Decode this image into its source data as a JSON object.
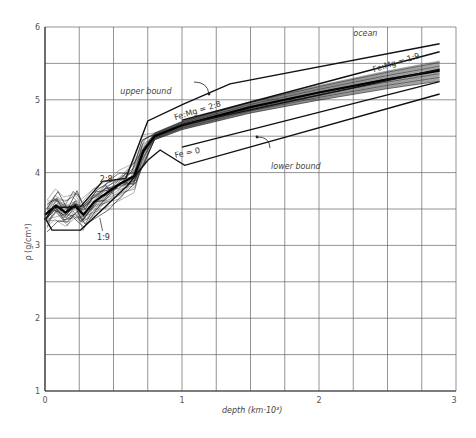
{
  "chart_data": {
    "type": "line",
    "title": "",
    "xlabel": "depth (km·10³)",
    "ylabel": "ρ (g/cm³)",
    "xlim": [
      0,
      3
    ],
    "ylim": [
      1,
      6
    ],
    "x_ticks": [
      "0",
      "1",
      "2",
      "3"
    ],
    "y_ticks": [
      "1",
      "2",
      "3",
      "4",
      "5",
      "6"
    ],
    "grid": true,
    "grid_x_step": 0.25,
    "grid_y_step": 0.5,
    "annotations": [
      {
        "text": "ocean",
        "x": 2.25,
        "y": 5.88,
        "italic": true
      },
      {
        "text": "upper bound",
        "x": 0.55,
        "y": 5.08,
        "italic": true
      },
      {
        "text": "lower bound",
        "x": 1.65,
        "y": 4.05,
        "italic": true
      },
      {
        "text": "Fe:Mg = 2:8",
        "x": 0.95,
        "y": 4.72,
        "rotate": -17
      },
      {
        "text": "Fe:Mg = 1:9",
        "x": 2.4,
        "y": 5.38,
        "rotate": -17
      },
      {
        "text": "Fe = 0",
        "x": 0.95,
        "y": 4.2,
        "rotate": -12
      },
      {
        "text": "2:8",
        "x": 0.4,
        "y": 3.87
      },
      {
        "text": "1:9",
        "x": 0.38,
        "y": 3.08
      }
    ],
    "series": [
      {
        "name": "upper bound",
        "style": "bold",
        "x": [
          0.0,
          0.06,
          0.26,
          0.42,
          0.59,
          0.75,
          1.01,
          1.35,
          2.88
        ],
        "y": [
          3.35,
          3.52,
          3.53,
          3.88,
          3.92,
          4.71,
          4.94,
          5.22,
          5.77
        ]
      },
      {
        "name": "lower bound",
        "style": "bold",
        "x": [
          0.0,
          0.05,
          0.26,
          0.4,
          0.6,
          0.75,
          0.84,
          1.02,
          2.88
        ],
        "y": [
          3.38,
          3.21,
          3.21,
          3.46,
          3.82,
          4.17,
          4.31,
          4.1,
          5.08
        ]
      },
      {
        "name": "Fe:Mg = 2:8",
        "style": "bold",
        "x": [
          1.0,
          2.88
        ],
        "y": [
          4.72,
          5.66
        ]
      },
      {
        "name": "Fe:Mg = 1:9",
        "style": "bold",
        "x": [
          1.0,
          2.88
        ],
        "y": [
          4.66,
          5.42
        ]
      },
      {
        "name": "Fe = 0",
        "style": "bold",
        "x": [
          1.0,
          2.88
        ],
        "y": [
          4.35,
          5.25
        ]
      },
      {
        "name": "model ensemble (center)",
        "style": "thin-bundle",
        "x": [
          0.0,
          0.08,
          0.15,
          0.22,
          0.28,
          0.36,
          0.45,
          0.55,
          0.65,
          0.72,
          0.8,
          1.0,
          1.5,
          2.0,
          2.5,
          2.88
        ],
        "y": [
          3.42,
          3.55,
          3.45,
          3.55,
          3.42,
          3.6,
          3.72,
          3.85,
          3.95,
          4.3,
          4.5,
          4.65,
          4.9,
          5.1,
          5.28,
          5.4
        ]
      }
    ]
  }
}
